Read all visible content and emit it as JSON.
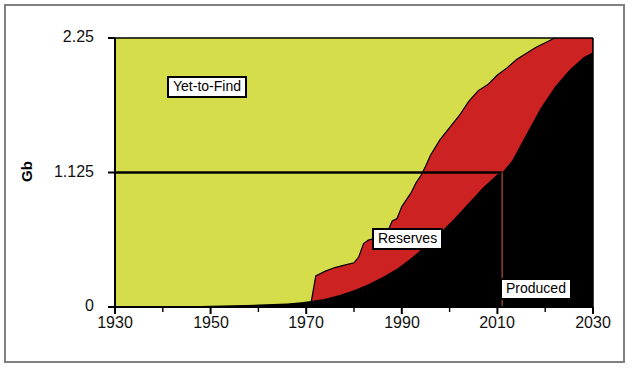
{
  "chart_data": {
    "type": "area",
    "title": "",
    "subtitle": "",
    "xlabel": "",
    "ylabel": "Gb",
    "xlim": [
      1930,
      2030
    ],
    "ylim": [
      0,
      2.25
    ],
    "xticks": [
      1930,
      1950,
      1970,
      1990,
      2010,
      2030
    ],
    "xtick_labels": [
      "1930",
      "1950",
      "1970",
      "1990",
      "2010",
      "2030"
    ],
    "x_minor_tick_interval": 10,
    "yticks": [
      0,
      1.125,
      2.25
    ],
    "ytick_labels": [
      "0",
      "1.125",
      "2.25"
    ],
    "grid": false,
    "legend_position": "inline-annotations",
    "stacking": "cumulative-total-constant-2.25",
    "annotations": [
      {
        "name": "yet-to-find-label",
        "text": "Yet-to-Find",
        "x": 1954,
        "y": 1.88
      },
      {
        "name": "reserves-label",
        "text": "Reserves",
        "x": 1992,
        "y": 0.52
      },
      {
        "name": "produced-label",
        "text": "Produced",
        "x": 2016,
        "y": 0.2
      }
    ],
    "reference_lines": [
      {
        "name": "half-depletion-horizontal",
        "orientation": "horizontal",
        "y": 1.125,
        "x_from": 1930,
        "x_to": 2011,
        "color": "#000000"
      },
      {
        "name": "half-depletion-vertical",
        "orientation": "vertical",
        "x": 2011,
        "y_from": 0,
        "y_to": 1.125,
        "color": "#8a3b26"
      }
    ],
    "series": [
      {
        "name": "Produced",
        "color": "#000000",
        "label": "Produced",
        "description": "Cumulative oil produced, lower boundary of stack at y=0",
        "x": [
          1930,
          1940,
          1950,
          1955,
          1960,
          1963,
          1966,
          1969,
          1971,
          1974,
          1977,
          1980,
          1983,
          1986,
          1989,
          1992,
          1995,
          1998,
          2001,
          2004,
          2007,
          2010,
          2011,
          2013,
          2016,
          2019,
          2022,
          2025,
          2028,
          2030
        ],
        "values": [
          0.0,
          0.0,
          0.01,
          0.015,
          0.02,
          0.025,
          0.03,
          0.04,
          0.05,
          0.07,
          0.1,
          0.14,
          0.19,
          0.25,
          0.32,
          0.41,
          0.51,
          0.62,
          0.74,
          0.87,
          1.0,
          1.11,
          1.125,
          1.22,
          1.44,
          1.66,
          1.84,
          1.98,
          2.09,
          2.13
        ]
      },
      {
        "name": "Reserves",
        "color": "#cc2222",
        "label": "Reserves",
        "description": "Cumulative discovered (produced + reserves), upper boundary of red band; stepped profile",
        "x": [
          1930,
          1950,
          1960,
          1964,
          1967,
          1970,
          1971,
          1972,
          1974,
          1976,
          1978,
          1980,
          1981,
          1982,
          1983,
          1984,
          1985,
          1986,
          1987,
          1988,
          1989,
          1990,
          1991,
          1992,
          1993,
          1994,
          1995,
          1996,
          1998,
          2000,
          2002,
          2004,
          2006,
          2008,
          2010,
          2012,
          2014,
          2016,
          2018,
          2020,
          2022,
          2026,
          2030
        ],
        "values": [
          0.0,
          0.0,
          0.01,
          0.012,
          0.015,
          0.02,
          0.03,
          0.26,
          0.3,
          0.33,
          0.35,
          0.37,
          0.42,
          0.53,
          0.56,
          0.57,
          0.6,
          0.62,
          0.63,
          0.72,
          0.74,
          0.84,
          0.9,
          0.96,
          1.04,
          1.1,
          1.18,
          1.27,
          1.4,
          1.5,
          1.6,
          1.72,
          1.81,
          1.86,
          1.94,
          2.0,
          2.07,
          2.12,
          2.17,
          2.21,
          2.25,
          2.25,
          2.25
        ]
      },
      {
        "name": "Yet-to-Find",
        "color": "#d6dd4a",
        "label": "Yet-to-Find",
        "description": "Remaining undiscovered: area between the discovered curve and the constant total of 2.25 Gb",
        "x": [
          1930,
          1970,
          1990,
          2010,
          2022,
          2030
        ],
        "values": [
          2.25,
          2.23,
          1.41,
          0.31,
          0.0,
          0.0
        ]
      }
    ]
  },
  "colors": {
    "yet_to_find": "#d6dd4a",
    "reserves": "#cc2222",
    "produced": "#000000",
    "axis": "#000000",
    "frame": "#808080",
    "vertical_marker": "#8a3b26",
    "label_background": "#ffffff",
    "label_border": "#000000",
    "background": "#ffffff"
  }
}
